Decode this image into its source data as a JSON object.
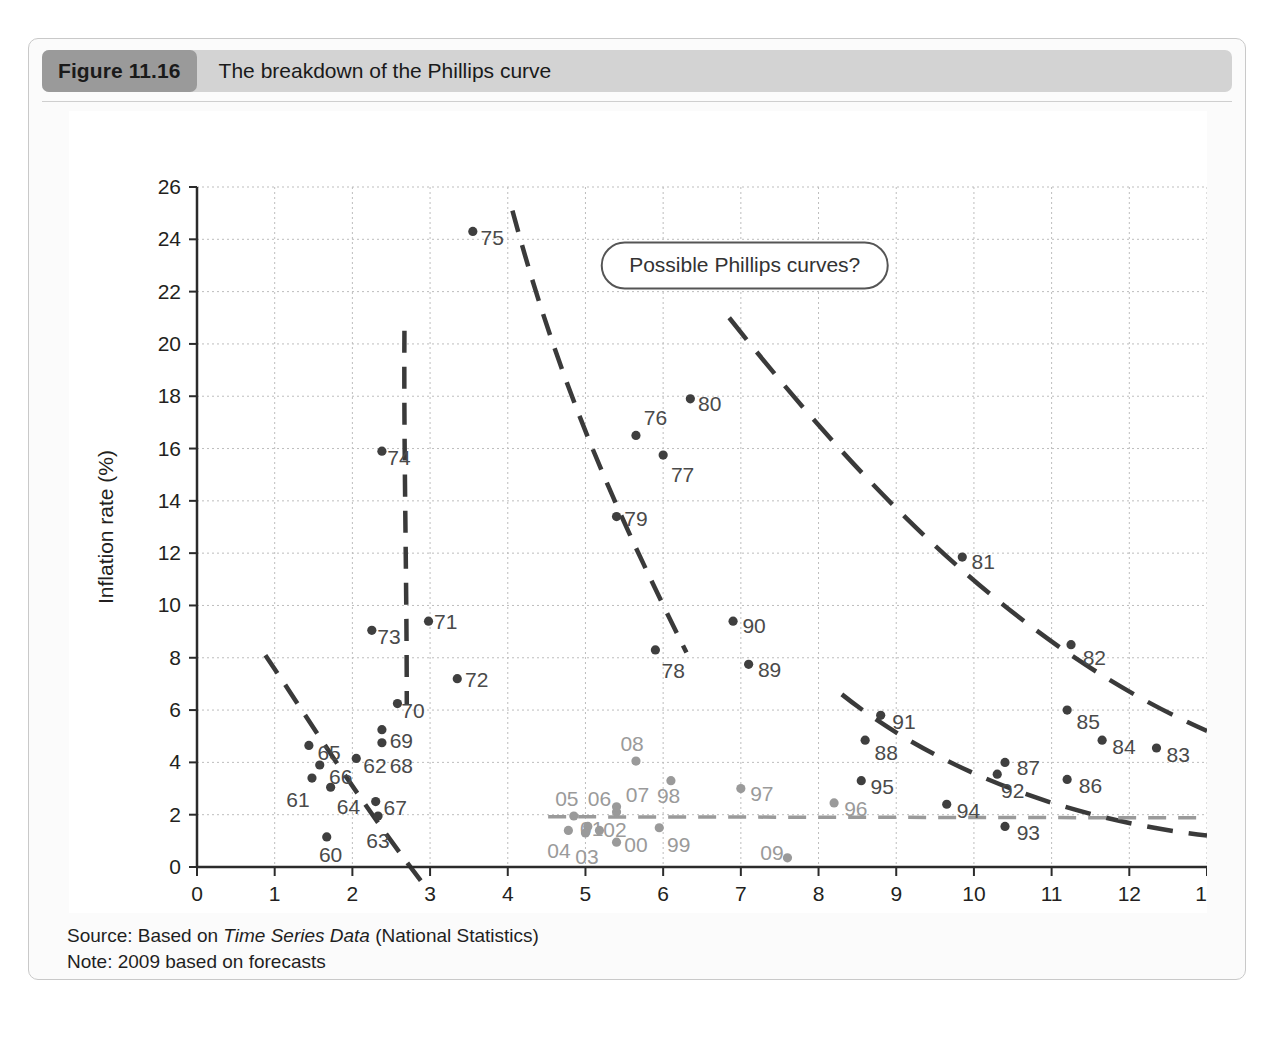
{
  "figure": {
    "number_label": "Figure 11.16",
    "title": "The breakdown of the Phillips curve",
    "source_prefix": "Source: Based on ",
    "source_italic": "Time Series Data",
    "source_suffix": " (National Statistics)",
    "note": "Note: 2009 based on forecasts"
  },
  "annotation": {
    "callout_label": "Possible Phillips curves?"
  },
  "colors": {
    "dark_point": "#3f3f3f",
    "gray_point": "#9a9a9a",
    "curve": "#3a3a3a",
    "gray_curve": "#9a9a9a",
    "grid": "#bdbdbd",
    "axis": "#2b2b2b",
    "caption_bar": "#d3d3d3",
    "caption_badge": "#9a9a9a"
  },
  "chart_data": {
    "type": "scatter",
    "title": "The breakdown of the Phillips curve",
    "xlabel": "Unemployment rate (%)",
    "ylabel": "Inflation rate (%)",
    "xlim": [
      0,
      13
    ],
    "ylim": [
      0,
      26
    ],
    "xticks": [
      0,
      1,
      2,
      3,
      4,
      5,
      6,
      7,
      8,
      9,
      10,
      11,
      12,
      13
    ],
    "yticks": [
      0,
      2,
      4,
      6,
      8,
      10,
      12,
      14,
      16,
      18,
      20,
      22,
      24,
      26
    ],
    "grid": true,
    "legend": "none",
    "series": [
      {
        "name": "1960s-1990s (dark)",
        "color": "#3f3f3f",
        "points": [
          {
            "label": "60",
            "x": 1.67,
            "y": 1.15,
            "lx": 1.72,
            "ly": 0.45,
            "anchor": "middle"
          },
          {
            "label": "61",
            "x": 1.48,
            "y": 3.4,
            "lx": 1.3,
            "ly": 2.55,
            "anchor": "middle"
          },
          {
            "label": "62",
            "x": 2.05,
            "y": 4.15,
            "lx": 2.14,
            "ly": 3.85,
            "anchor": "start"
          },
          {
            "label": "63",
            "x": 2.33,
            "y": 1.95,
            "lx": 2.33,
            "ly": 1.0,
            "anchor": "middle"
          },
          {
            "label": "64",
            "x": 1.72,
            "y": 3.05,
            "lx": 1.95,
            "ly": 2.3,
            "anchor": "middle"
          },
          {
            "label": "65",
            "x": 1.44,
            "y": 4.65,
            "lx": 1.55,
            "ly": 4.35,
            "anchor": "start"
          },
          {
            "label": "66",
            "x": 1.58,
            "y": 3.9,
            "lx": 1.7,
            "ly": 3.45,
            "anchor": "start"
          },
          {
            "label": "67",
            "x": 2.3,
            "y": 2.5,
            "lx": 2.4,
            "ly": 2.25,
            "anchor": "start"
          },
          {
            "label": "68",
            "x": 2.38,
            "y": 4.75,
            "lx": 2.48,
            "ly": 3.85,
            "anchor": "start"
          },
          {
            "label": "69",
            "x": 2.38,
            "y": 5.25,
            "lx": 2.48,
            "ly": 4.8,
            "anchor": "start"
          },
          {
            "label": "70",
            "x": 2.58,
            "y": 6.25,
            "lx": 2.63,
            "ly": 5.95,
            "anchor": "start"
          },
          {
            "label": "71",
            "x": 2.98,
            "y": 9.4,
            "lx": 3.05,
            "ly": 9.35,
            "anchor": "start"
          },
          {
            "label": "72",
            "x": 3.35,
            "y": 7.2,
            "lx": 3.45,
            "ly": 7.15,
            "anchor": "start"
          },
          {
            "label": "73",
            "x": 2.25,
            "y": 9.05,
            "lx": 2.32,
            "ly": 8.8,
            "anchor": "start"
          },
          {
            "label": "74",
            "x": 2.38,
            "y": 15.9,
            "lx": 2.45,
            "ly": 15.65,
            "anchor": "start"
          },
          {
            "label": "75",
            "x": 3.55,
            "y": 24.3,
            "lx": 3.65,
            "ly": 24.05,
            "anchor": "start"
          },
          {
            "label": "76",
            "x": 5.65,
            "y": 16.5,
            "lx": 5.75,
            "ly": 17.15,
            "anchor": "start"
          },
          {
            "label": "77",
            "x": 6.0,
            "y": 15.75,
            "lx": 6.1,
            "ly": 15.0,
            "anchor": "start"
          },
          {
            "label": "78",
            "x": 5.9,
            "y": 8.3,
            "lx": 5.98,
            "ly": 7.5,
            "anchor": "start"
          },
          {
            "label": "79",
            "x": 5.4,
            "y": 13.4,
            "lx": 5.5,
            "ly": 13.3,
            "anchor": "start"
          },
          {
            "label": "80",
            "x": 6.35,
            "y": 17.9,
            "lx": 6.45,
            "ly": 17.7,
            "anchor": "start"
          },
          {
            "label": "81",
            "x": 9.85,
            "y": 11.85,
            "lx": 9.97,
            "ly": 11.65,
            "anchor": "start"
          },
          {
            "label": "82",
            "x": 11.25,
            "y": 8.5,
            "lx": 11.4,
            "ly": 8.0,
            "anchor": "start"
          },
          {
            "label": "83",
            "x": 12.35,
            "y": 4.55,
            "lx": 12.48,
            "ly": 4.3,
            "anchor": "start"
          },
          {
            "label": "84",
            "x": 11.65,
            "y": 4.85,
            "lx": 11.78,
            "ly": 4.6,
            "anchor": "start"
          },
          {
            "label": "85",
            "x": 11.2,
            "y": 6.0,
            "lx": 11.32,
            "ly": 5.55,
            "anchor": "start"
          },
          {
            "label": "86",
            "x": 11.2,
            "y": 3.35,
            "lx": 11.35,
            "ly": 3.1,
            "anchor": "start"
          },
          {
            "label": "87",
            "x": 10.4,
            "y": 4.0,
            "lx": 10.55,
            "ly": 3.8,
            "anchor": "start"
          },
          {
            "label": "88",
            "x": 8.6,
            "y": 4.85,
            "lx": 8.72,
            "ly": 4.35,
            "anchor": "start"
          },
          {
            "label": "89",
            "x": 7.1,
            "y": 7.75,
            "lx": 7.22,
            "ly": 7.55,
            "anchor": "start"
          },
          {
            "label": "90",
            "x": 6.9,
            "y": 9.4,
            "lx": 7.02,
            "ly": 9.2,
            "anchor": "start"
          },
          {
            "label": "91",
            "x": 8.8,
            "y": 5.8,
            "lx": 8.95,
            "ly": 5.55,
            "anchor": "start"
          },
          {
            "label": "92",
            "x": 10.3,
            "y": 3.55,
            "lx": 10.35,
            "ly": 2.9,
            "anchor": "start"
          },
          {
            "label": "93",
            "x": 10.4,
            "y": 1.55,
            "lx": 10.55,
            "ly": 1.3,
            "anchor": "start"
          },
          {
            "label": "94",
            "x": 9.65,
            "y": 2.4,
            "lx": 9.78,
            "ly": 2.15,
            "anchor": "start"
          },
          {
            "label": "95",
            "x": 8.55,
            "y": 3.3,
            "lx": 8.67,
            "ly": 3.05,
            "anchor": "start"
          }
        ]
      },
      {
        "name": "1996-2009 (gray)",
        "color": "#9a9a9a",
        "points": [
          {
            "label": "96",
            "x": 8.2,
            "y": 2.45,
            "lx": 8.33,
            "ly": 2.2,
            "anchor": "start"
          },
          {
            "label": "97",
            "x": 7.0,
            "y": 3.0,
            "lx": 7.12,
            "ly": 2.8,
            "anchor": "start"
          },
          {
            "label": "98",
            "x": 6.1,
            "y": 3.3,
            "lx": 5.92,
            "ly": 2.7,
            "anchor": "start"
          },
          {
            "label": "99",
            "x": 5.95,
            "y": 1.5,
            "lx": 6.05,
            "ly": 0.85,
            "anchor": "start"
          },
          {
            "label": "00",
            "x": 5.4,
            "y": 0.95,
            "lx": 5.5,
            "ly": 0.85,
            "anchor": "start"
          },
          {
            "label": "01",
            "x": 5.03,
            "y": 1.55,
            "lx": 4.93,
            "ly": 1.45,
            "anchor": "start"
          },
          {
            "label": "02",
            "x": 5.18,
            "y": 1.4,
            "lx": 5.23,
            "ly": 1.4,
            "anchor": "start"
          },
          {
            "label": "03",
            "x": 5.0,
            "y": 1.3,
            "lx": 5.02,
            "ly": 0.4,
            "anchor": "middle"
          },
          {
            "label": "04",
            "x": 4.78,
            "y": 1.4,
            "lx": 4.66,
            "ly": 0.6,
            "anchor": "middle"
          },
          {
            "label": "05",
            "x": 4.85,
            "y": 1.95,
            "lx": 4.76,
            "ly": 2.6,
            "anchor": "middle"
          },
          {
            "label": "06",
            "x": 5.4,
            "y": 2.1,
            "lx": 5.18,
            "ly": 2.6,
            "anchor": "middle"
          },
          {
            "label": "07",
            "x": 5.4,
            "y": 2.3,
            "lx": 5.52,
            "ly": 2.75,
            "anchor": "start"
          },
          {
            "label": "08",
            "x": 5.65,
            "y": 4.05,
            "lx": 5.6,
            "ly": 4.7,
            "anchor": "middle"
          },
          {
            "label": "09",
            "x": 7.6,
            "y": 0.35,
            "lx": 7.4,
            "ly": 0.55,
            "anchor": "middle"
          }
        ]
      }
    ],
    "annotation_curves": [
      {
        "name": "phillips-curve-1960s",
        "color": "#3a3a3a",
        "dash": "22 14",
        "path": "M 0.88,8.1 C 1.45,5.6 2.0,2.9 2.9,-0.6"
      },
      {
        "name": "phillips-curve-vertical-1970s",
        "color": "#3a3a3a",
        "dash": "22 14",
        "path": "M 2.67,20.5 C 2.66,16.0 2.70,11.0 2.70,6.2"
      },
      {
        "name": "phillips-curve-mid-1970s",
        "color": "#3a3a3a",
        "dash": "22 14",
        "path": "M 4.06,25.1 C 4.7,18.0 5.5,13.0 6.3,8.2"
      },
      {
        "name": "phillips-curve-1980s-outer",
        "color": "#3a3a3a",
        "dash": "28 16",
        "path": "M 6.85,21.0 C 8.4,15.2 10.4,8.6 13.0,5.2"
      },
      {
        "name": "phillips-curve-1990s",
        "color": "#3a3a3a",
        "dash": "26 16",
        "path": "M 8.3,6.6 C 9.4,4.0 11.0,1.9 13.0,1.2"
      },
      {
        "name": "phillips-curve-flat-2000s",
        "color": "#9a9a9a",
        "dash": "18 12",
        "path": "M 4.52,1.92 L 12.9,1.88"
      }
    ],
    "callout": {
      "text": "Possible Phillips curves?",
      "x": 7.05,
      "y": 23.0
    }
  }
}
